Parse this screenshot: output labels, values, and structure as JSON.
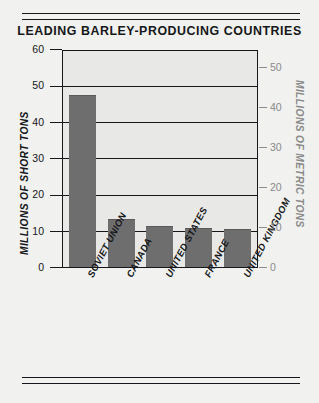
{
  "chart_data": {
    "type": "bar",
    "title": "LEADING BARLEY-PRODUCING COUNTRIES",
    "categories": [
      "SOVIET UNION",
      "CANADA",
      "UNITED STATES",
      "FRANCE",
      "UNITED KINGDOM"
    ],
    "values": [
      47,
      13,
      11,
      10.5,
      10.3
    ],
    "xlabel": "",
    "ylabel": "MILLIONS OF SHORT TONS",
    "ylabel_secondary": "MILLIONS OF METRIC TONS",
    "ylim": [
      0,
      60
    ],
    "ylim_secondary": [
      0,
      54.4
    ],
    "yticks": [
      "0",
      "10",
      "20",
      "30",
      "40",
      "50",
      "60"
    ],
    "yticks_secondary": [
      "0",
      "10",
      "20",
      "30",
      "40",
      "50"
    ],
    "grid": true,
    "legend": "none",
    "series": [
      {
        "name": "Barley production",
        "values": [
          47,
          13,
          11,
          10.5,
          10.3
        ]
      }
    ],
    "colors": {
      "bar_fill": "#6e6e6e",
      "plot_background": "#e8e8e6",
      "page_background": "#f1f1ef",
      "axis": "#15171a",
      "secondary_axis": "#8a8a8a"
    }
  }
}
